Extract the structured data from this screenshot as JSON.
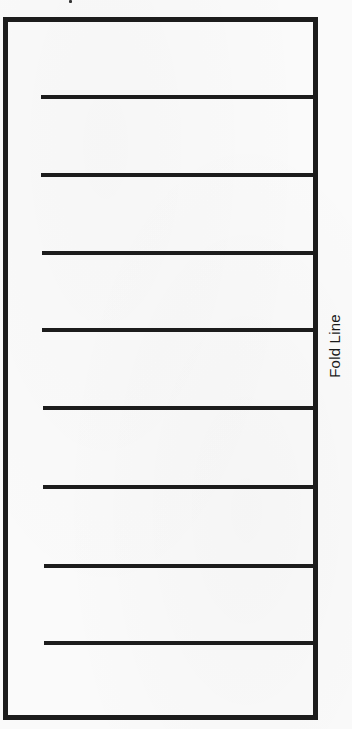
{
  "document": {
    "type": "fold-guide-sheet",
    "fold_label": "Fold Line",
    "line_color": "#1c1c1c",
    "background_color": "#fafafa",
    "frame": {
      "left": 3,
      "top": 17,
      "right": 318,
      "bottom": 720,
      "stroke_width": 5
    },
    "writing_lines": [
      {
        "index": 1,
        "y": 95,
        "x_start": 41
      },
      {
        "index": 2,
        "y": 173,
        "x_start": 41
      },
      {
        "index": 3,
        "y": 251,
        "x_start": 42
      },
      {
        "index": 4,
        "y": 328,
        "x_start": 42
      },
      {
        "index": 5,
        "y": 406,
        "x_start": 43
      },
      {
        "index": 6,
        "y": 485,
        "x_start": 43
      },
      {
        "index": 7,
        "y": 564,
        "x_start": 44
      },
      {
        "index": 8,
        "y": 641,
        "x_start": 44
      }
    ],
    "line_end_x": 313,
    "line_thickness": 4
  }
}
